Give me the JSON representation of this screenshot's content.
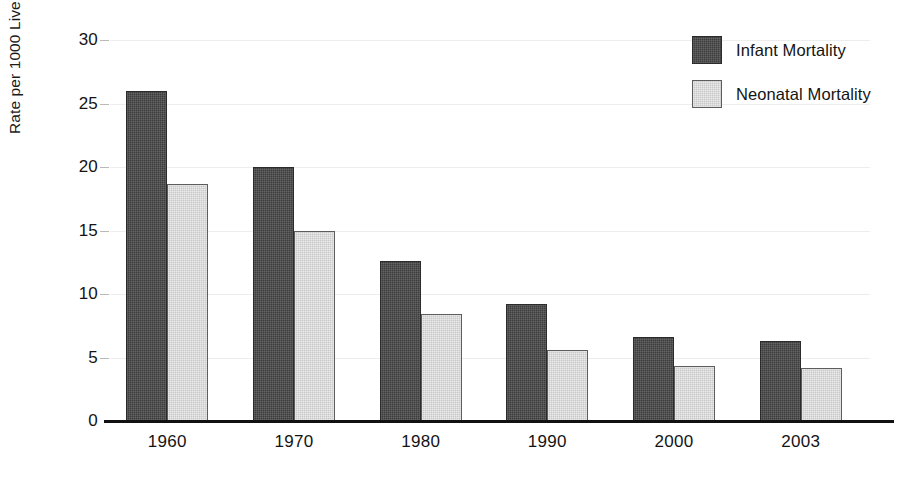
{
  "chart_data": {
    "type": "bar",
    "title": "",
    "xlabel": "",
    "ylabel": "Rate per 1000 Live Births",
    "categories": [
      "1960",
      "1970",
      "1980",
      "1990",
      "2000",
      "2003"
    ],
    "series": [
      {
        "name": "Infant Mortality",
        "color": "#3d3d3d",
        "values": [
          26.0,
          20.0,
          12.6,
          9.2,
          6.6,
          6.3
        ]
      },
      {
        "name": "Neonatal Mortality",
        "color": "#c9c9c9",
        "values": [
          18.7,
          15.0,
          8.4,
          5.6,
          4.3,
          4.2
        ]
      }
    ],
    "ylim": [
      0,
      30
    ],
    "yticks": [
      0,
      5,
      10,
      15,
      20,
      25,
      30
    ],
    "ytick_labels": [
      "0",
      "5",
      "10",
      "15",
      "20",
      "25",
      "30"
    ],
    "grid": true,
    "legend_position": "top-right"
  },
  "legend": {
    "items": [
      {
        "label": "Infant Mortality",
        "swatch": "infant"
      },
      {
        "label": "Neonatal Mortality",
        "swatch": "neonatal"
      }
    ]
  }
}
